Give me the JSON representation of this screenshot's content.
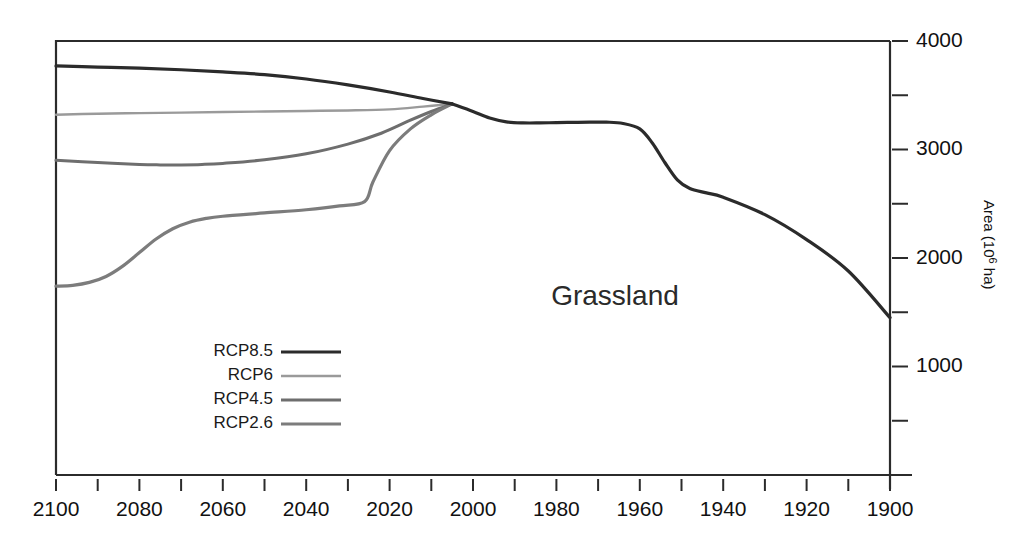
{
  "chart_data": {
    "type": "line",
    "title": "",
    "annotation": "Grassland",
    "xlabel": "",
    "ylabel": "Area (10⁶ ha)",
    "ylabel_parts": {
      "text": "Area (10",
      "sup": "6",
      "tail": " ha)"
    },
    "x_axis": {
      "reversed": true,
      "min": 1900,
      "max": 2100,
      "tick_interval": 10,
      "label_interval": 20,
      "tick_values": [
        2100,
        2090,
        2080,
        2070,
        2060,
        2050,
        2040,
        2030,
        2020,
        2010,
        2000,
        1990,
        1980,
        1970,
        1960,
        1950,
        1940,
        1930,
        1920,
        1910,
        1900
      ],
      "tick_labels": [
        "2100",
        "2080",
        "2060",
        "2040",
        "2020",
        "2000",
        "1980",
        "1960",
        "1940",
        "1920",
        "1900"
      ],
      "labeled_values": [
        2100,
        2080,
        2060,
        2040,
        2020,
        2000,
        1980,
        1960,
        1940,
        1920,
        1900
      ]
    },
    "y_axis": {
      "position": "right",
      "min": 0,
      "max": 4000,
      "tick_interval": 500,
      "tick_values": [
        4000,
        3500,
        3000,
        2500,
        2000,
        1500,
        1000,
        500,
        0
      ],
      "labeled_values": [
        4000,
        3000,
        2000,
        1000
      ],
      "tick_labels": [
        "4000",
        "3000",
        "2000",
        "1000"
      ]
    },
    "grid": false,
    "legend": {
      "position": "bottom-left",
      "entries": [
        {
          "name": "RCP8.5",
          "color": "#2b2b2b",
          "width": 3.2
        },
        {
          "name": "RCP6",
          "color": "#9a9a9a",
          "width": 2.4
        },
        {
          "name": "RCP4.5",
          "color": "#6e6e6e",
          "width": 3.0
        },
        {
          "name": "RCP2.6",
          "color": "#7c7c7c",
          "width": 3.2
        }
      ]
    },
    "series": [
      {
        "name": "Historical",
        "color": "#2b2b2b",
        "width": 3.2,
        "x": [
          2005,
          2000,
          1996,
          1992,
          1988,
          1984,
          1980,
          1976,
          1972,
          1968,
          1964,
          1960,
          1957,
          1954,
          1951,
          1948,
          1944,
          1940,
          1930,
          1920,
          1910,
          1900
        ],
        "values": [
          3420,
          3350,
          3290,
          3255,
          3245,
          3245,
          3248,
          3250,
          3252,
          3252,
          3240,
          3190,
          3060,
          2880,
          2720,
          2640,
          2600,
          2560,
          2400,
          2170,
          1880,
          1450
        ]
      },
      {
        "name": "RCP8.5",
        "color": "#2b2b2b",
        "width": 3.2,
        "x": [
          2100,
          2090,
          2080,
          2070,
          2060,
          2050,
          2040,
          2030,
          2020,
          2012,
          2005
        ],
        "values": [
          3770,
          3760,
          3750,
          3735,
          3715,
          3690,
          3650,
          3595,
          3530,
          3470,
          3420
        ]
      },
      {
        "name": "RCP6",
        "color": "#9a9a9a",
        "width": 2.4,
        "x": [
          2100,
          2090,
          2080,
          2070,
          2060,
          2050,
          2040,
          2030,
          2020,
          2012,
          2005
        ],
        "values": [
          3320,
          3330,
          3335,
          3340,
          3345,
          3350,
          3355,
          3360,
          3370,
          3395,
          3420
        ]
      },
      {
        "name": "RCP4.5",
        "color": "#6e6e6e",
        "width": 3.0,
        "x": [
          2100,
          2090,
          2080,
          2075,
          2070,
          2065,
          2060,
          2050,
          2040,
          2030,
          2022,
          2015,
          2010,
          2005
        ],
        "values": [
          2900,
          2880,
          2862,
          2858,
          2858,
          2862,
          2872,
          2905,
          2960,
          3050,
          3150,
          3270,
          3350,
          3420
        ]
      },
      {
        "name": "RCP2.6",
        "color": "#7c7c7c",
        "width": 3.2,
        "x": [
          2100,
          2096,
          2092,
          2088,
          2084,
          2080,
          2076,
          2072,
          2068,
          2064,
          2060,
          2050,
          2040,
          2032,
          2026,
          2024,
          2020,
          2015,
          2010,
          2005
        ],
        "values": [
          1740,
          1748,
          1775,
          1830,
          1925,
          2050,
          2175,
          2270,
          2330,
          2365,
          2385,
          2415,
          2445,
          2480,
          2520,
          2700,
          2990,
          3190,
          3320,
          3420
        ]
      }
    ]
  },
  "figure": {
    "background_color": "#ffffff",
    "frame_color": "#2b2b2b"
  }
}
